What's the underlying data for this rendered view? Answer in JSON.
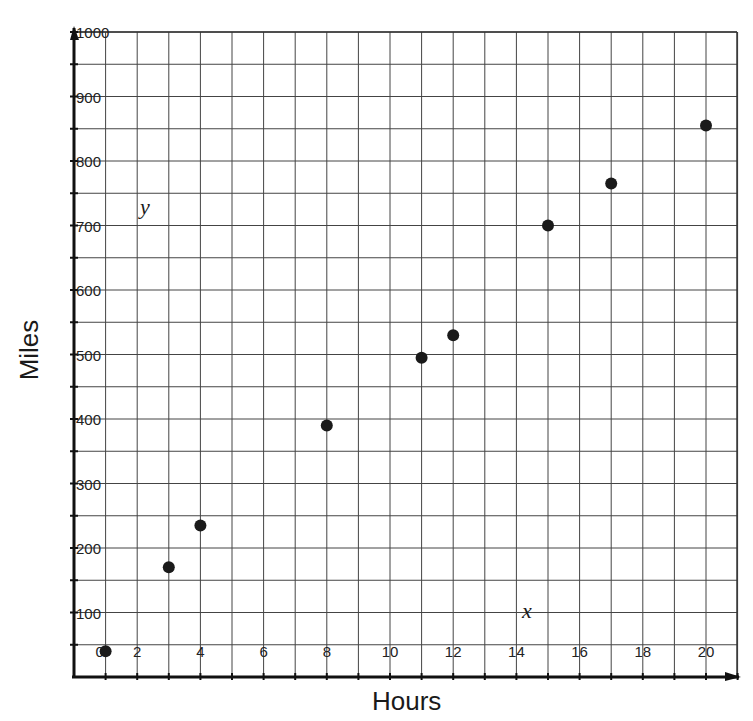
{
  "chart_data": {
    "type": "scatter",
    "title": "",
    "xlabel": "Hours",
    "ylabel": "Miles",
    "xlim": [
      0,
      21
    ],
    "ylim": [
      0,
      1000
    ],
    "x_ticks": [
      "0",
      "2",
      "4",
      "6",
      "8",
      "10",
      "12",
      "14",
      "16",
      "18",
      "20"
    ],
    "y_ticks": [
      "100",
      "200",
      "300",
      "400",
      "500",
      "600",
      "700",
      "800",
      "900",
      "1000"
    ],
    "grid": true,
    "grid_x_step": 1,
    "grid_y_step": 50,
    "axis_annotations": {
      "x": "x",
      "y": "y"
    },
    "points": [
      {
        "x": 1,
        "y": 40
      },
      {
        "x": 3,
        "y": 170
      },
      {
        "x": 4,
        "y": 235
      },
      {
        "x": 8,
        "y": 390
      },
      {
        "x": 11,
        "y": 495
      },
      {
        "x": 12,
        "y": 530
      },
      {
        "x": 15,
        "y": 700
      },
      {
        "x": 17,
        "y": 765
      },
      {
        "x": 20,
        "y": 855
      }
    ],
    "legend": null
  },
  "labels": {
    "xlabel": "Hours",
    "ylabel": "Miles",
    "x_var": "x",
    "y_var": "y"
  }
}
